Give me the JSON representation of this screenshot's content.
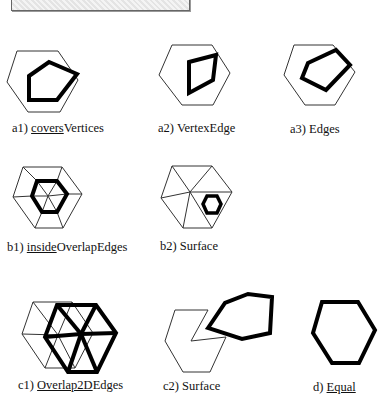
{
  "figure": {
    "header_box": "hatched-title-box",
    "panels": [
      {
        "id": "a1",
        "prefix": "a1) ",
        "underlined": "covers",
        "rest": "Vertices"
      },
      {
        "id": "a2",
        "prefix": "a2) ",
        "underlined": "",
        "rest": "VertexEdge"
      },
      {
        "id": "a3",
        "prefix": "a3) ",
        "underlined": "",
        "rest": "Edges"
      },
      {
        "id": "b1",
        "prefix": "b1) ",
        "underlined": "inside",
        "rest": "OverlapEdges"
      },
      {
        "id": "b2",
        "prefix": "b2) ",
        "underlined": "",
        "rest": "Surface"
      },
      {
        "id": "c1",
        "prefix": "c1) ",
        "underlined": "Overlap2D",
        "rest": "Edges"
      },
      {
        "id": "c2",
        "prefix": "c2) ",
        "underlined": "",
        "rest": "Surface"
      },
      {
        "id": "d",
        "prefix": "d) ",
        "underlined": "Equal",
        "rest": ""
      }
    ]
  }
}
